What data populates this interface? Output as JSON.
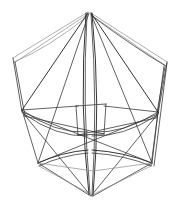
{
  "figure": {
    "canvas": {
      "width": 182,
      "height": 207,
      "background": "#ffffff"
    },
    "colors": {
      "stroke_default": "#3a3a3a",
      "stroke_light": "#8d8d8d",
      "stroke_dark": "#1e1e1e",
      "background": "#ffffff"
    },
    "vertices": {
      "top_apex": {
        "x": 88,
        "y": 12
      },
      "top_apex_b": {
        "x": 91,
        "y": 13
      },
      "left_upper": {
        "x": 13,
        "y": 58
      },
      "left_upper_b": {
        "x": 14,
        "y": 64
      },
      "right_upper": {
        "x": 167,
        "y": 62
      },
      "right_upper_b": {
        "x": 166,
        "y": 68
      },
      "left_mid": {
        "x": 22,
        "y": 110
      },
      "left_mid_b": {
        "x": 24,
        "y": 116
      },
      "right_mid": {
        "x": 158,
        "y": 112
      },
      "right_mid_b": {
        "x": 156,
        "y": 118
      },
      "left_lower": {
        "x": 38,
        "y": 163
      },
      "right_lower": {
        "x": 152,
        "y": 163
      },
      "bottom_apex": {
        "x": 93,
        "y": 196
      },
      "bottom_apex_b": {
        "x": 89,
        "y": 195
      },
      "center_tl": {
        "x": 76,
        "y": 106
      },
      "center_tr": {
        "x": 106,
        "y": 104
      },
      "center_bl": {
        "x": 78,
        "y": 135
      },
      "center_br": {
        "x": 104,
        "y": 134
      },
      "spine_left_top": {
        "x": 86,
        "y": 14
      },
      "spine_right_top": {
        "x": 93,
        "y": 14
      }
    },
    "edges": [
      {
        "name": "rim-upper-left",
        "d": "M 88 12 L 13 58",
        "weight": "light"
      },
      {
        "name": "rim-upper-right",
        "d": "M 91 13 L 167 62",
        "weight": "light"
      },
      {
        "name": "rim-upper-left-b",
        "d": "M 88 14 L 14 63",
        "weight": "light"
      },
      {
        "name": "rim-upper-right-b",
        "d": "M 91 15 L 166 66",
        "weight": "light"
      },
      {
        "name": "rim-curve-left",
        "d": "M 88 16 Q 48 48 14 62",
        "weight": "light"
      },
      {
        "name": "rim-curve-right",
        "d": "M 92 16 Q 138 50 166 66",
        "weight": "default"
      },
      {
        "name": "side-left-outer",
        "d": "M 13 58 L 22 112",
        "weight": "default"
      },
      {
        "name": "side-left-inner",
        "d": "M 15 62 L 25 116",
        "weight": "default"
      },
      {
        "name": "side-right-outer",
        "d": "M 167 62 L 158 114",
        "weight": "default"
      },
      {
        "name": "side-right-inner",
        "d": "M 165 67 L 156 118",
        "weight": "default"
      },
      {
        "name": "side-right-long-a",
        "d": "M 167 63 L 154 166",
        "weight": "default"
      },
      {
        "name": "side-right-long-b",
        "d": "M 164 66 L 151 166",
        "weight": "default"
      },
      {
        "name": "spine-left",
        "d": "M 86 13 Q 79 105 89 195",
        "weight": "dark"
      },
      {
        "name": "spine-right",
        "d": "M 92 13 Q 101 105 93 196",
        "weight": "dark"
      },
      {
        "name": "spine-left-2",
        "d": "M 87 14 Q 82 106 90 194",
        "weight": "default"
      },
      {
        "name": "spine-right-2",
        "d": "M 91 14 Q 98 106 92 195",
        "weight": "default"
      },
      {
        "name": "ray-apex-leftmid",
        "d": "M 88 13 L 22 110",
        "weight": "dark"
      },
      {
        "name": "ray-apex-rightmid",
        "d": "M 91 13 L 158 112",
        "weight": "dark"
      },
      {
        "name": "ray-apex-leftlower",
        "d": "M 89 13 L 38 163",
        "weight": "default"
      },
      {
        "name": "ray-apex-rightlower",
        "d": "M 91 14 L 152 163",
        "weight": "default"
      },
      {
        "name": "waist-curve-left",
        "d": "M 22 110 Q 55 134 88 132",
        "weight": "default"
      },
      {
        "name": "waist-curve-right",
        "d": "M 158 112 Q 124 134 92 132",
        "weight": "default"
      },
      {
        "name": "waist-curve-left-b",
        "d": "M 24 114 Q 56 137 88 136",
        "weight": "default"
      },
      {
        "name": "waist-curve-right-b",
        "d": "M 156 116 Q 123 137 92 136",
        "weight": "default"
      },
      {
        "name": "band-left-upper",
        "d": "M 22 110 L 78 106",
        "weight": "default"
      },
      {
        "name": "band-right-upper",
        "d": "M 158 112 L 104 106",
        "weight": "default"
      },
      {
        "name": "deep-curve-left",
        "d": "M 38 163 Q 62 152 88 150",
        "weight": "dark"
      },
      {
        "name": "deep-curve-right",
        "d": "M 152 163 Q 124 152 92 150",
        "weight": "dark"
      },
      {
        "name": "deep-curve-left-b",
        "d": "M 39 166 Q 63 155 88 153",
        "weight": "default"
      },
      {
        "name": "deep-curve-right-b",
        "d": "M 151 166 Q 125 155 92 153",
        "weight": "default"
      },
      {
        "name": "base-left",
        "d": "M 38 163 L 89 195",
        "weight": "default"
      },
      {
        "name": "base-right",
        "d": "M 152 163 L 93 196",
        "weight": "default"
      },
      {
        "name": "base-left-b",
        "d": "M 39 166 L 90 194",
        "weight": "light"
      },
      {
        "name": "base-right-b",
        "d": "M 151 166 L 92 195",
        "weight": "light"
      },
      {
        "name": "cross-lm-to-rl",
        "d": "M 22 112 L 152 163",
        "weight": "default"
      },
      {
        "name": "cross-rm-to-ll",
        "d": "M 158 114 L 38 163",
        "weight": "default"
      },
      {
        "name": "cross-lm-to-bottom",
        "d": "M 23 113 L 91 196",
        "weight": "default"
      },
      {
        "name": "cross-rm-to-bottom",
        "d": "M 157 115 L 91 196",
        "weight": "default"
      },
      {
        "name": "left-mid-to-lower",
        "d": "M 22 110 L 38 163",
        "weight": "default"
      },
      {
        "name": "right-mid-to-lower",
        "d": "M 158 112 L 152 163",
        "weight": "default"
      },
      {
        "name": "box-top",
        "d": "M 76 106 L 106 104",
        "weight": "default"
      },
      {
        "name": "box-bottom",
        "d": "M 78 135 L 104 134",
        "weight": "default"
      },
      {
        "name": "box-left",
        "d": "M 76 106 L 78 135",
        "weight": "default"
      },
      {
        "name": "box-right",
        "d": "M 106 104 L 104 134",
        "weight": "default"
      },
      {
        "name": "chord-left-low",
        "d": "M 24 116 L 104 134",
        "weight": "default"
      },
      {
        "name": "chord-right-low",
        "d": "M 156 118 L 78 135",
        "weight": "default"
      },
      {
        "name": "lower-rim-left",
        "d": "M 38 163 L 93 171",
        "weight": "light"
      },
      {
        "name": "lower-rim-right",
        "d": "M 152 163 L 93 171",
        "weight": "light"
      }
    ]
  }
}
